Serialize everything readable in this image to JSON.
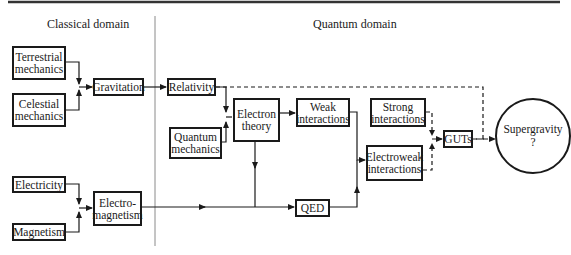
{
  "domains": {
    "classical_label": "Classical domain",
    "quantum_label": "Quantum domain"
  },
  "nodes": {
    "terrestrial_mechanics": "Terrestrial\nmechanics",
    "celestial_mechanics": "Celestial\nmechanics",
    "gravitation": "Gravitation",
    "relativity": "Relativity",
    "electron_theory": "Electron\ntheory",
    "quantum_mechanics": "Quantum\nmechanics",
    "weak_interactions": "Weak\ninteractions",
    "strong_interactions": "Strong\ninteractions",
    "electroweak_interactions": "Electroweak\ninteractions",
    "guts": "GUTs",
    "supergravity": "Supergravity\n?",
    "electricity": "Electricity",
    "magnetism": "Magnetism",
    "electromagnetism": "Electro-\nmagnetism",
    "qed": "QED"
  },
  "edges": [
    {
      "from": "terrestrial_mechanics",
      "to": "gravitation",
      "style": "solid"
    },
    {
      "from": "celestial_mechanics",
      "to": "gravitation",
      "style": "solid"
    },
    {
      "from": "gravitation",
      "to": "relativity",
      "style": "solid"
    },
    {
      "from": "relativity",
      "to": "electron_theory",
      "style": "solid"
    },
    {
      "from": "quantum_mechanics",
      "to": "electron_theory",
      "style": "solid"
    },
    {
      "from": "electron_theory",
      "to": "weak_interactions",
      "style": "solid"
    },
    {
      "from": "electron_theory",
      "to": "qed",
      "style": "solid"
    },
    {
      "from": "weak_interactions",
      "to": "electroweak_interactions",
      "style": "solid"
    },
    {
      "from": "qed",
      "to": "electroweak_interactions",
      "style": "solid"
    },
    {
      "from": "electricity",
      "to": "electromagnetism",
      "style": "solid"
    },
    {
      "from": "magnetism",
      "to": "electromagnetism",
      "style": "solid"
    },
    {
      "from": "electromagnetism",
      "to": "qed",
      "style": "solid"
    },
    {
      "from": "strong_interactions",
      "to": "guts",
      "style": "dashed"
    },
    {
      "from": "electroweak_interactions",
      "to": "guts",
      "style": "dashed"
    },
    {
      "from": "guts",
      "to": "supergravity",
      "style": "dashed"
    },
    {
      "from": "relativity",
      "to": "supergravity",
      "style": "dashed"
    }
  ],
  "colors": {
    "ink": "#1a1a1a",
    "divider": "#8a8a8a",
    "background": "#ffffff"
  }
}
